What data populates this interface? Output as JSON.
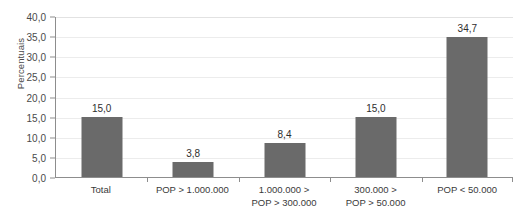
{
  "chart_data": {
    "type": "bar",
    "title": "",
    "xlabel": "",
    "ylabel": "Percentuais",
    "categories": [
      "Total",
      "POP > 1.000.000",
      "1.000.000 >\nPOP > 300.000",
      "300.000 >\nPOP > 50.000",
      "POP < 50.000"
    ],
    "values": [
      15.0,
      3.8,
      8.4,
      15.0,
      34.7
    ],
    "value_labels": [
      "15,0",
      "3,8",
      "8,4",
      "15,0",
      "34,7"
    ],
    "ylim": [
      0,
      40
    ],
    "ytick_step": 5,
    "ytick_labels": [
      "40,0",
      "35,0",
      "30,0",
      "25,0",
      "20,0",
      "15,0",
      "10,0",
      "5,0",
      "0,0"
    ],
    "ytick_values": [
      40,
      35,
      30,
      25,
      20,
      15,
      10,
      5,
      0
    ],
    "grid": true,
    "legend": false,
    "legend_position": "none",
    "colors": {
      "bar": "#6a6a6a",
      "gridline": "#ececec",
      "axis": "#8d8d8d",
      "text": "#3a3a3a",
      "value_text": "#2e2e2e",
      "background": "#ffffff"
    }
  },
  "cropped_title": "‌"
}
